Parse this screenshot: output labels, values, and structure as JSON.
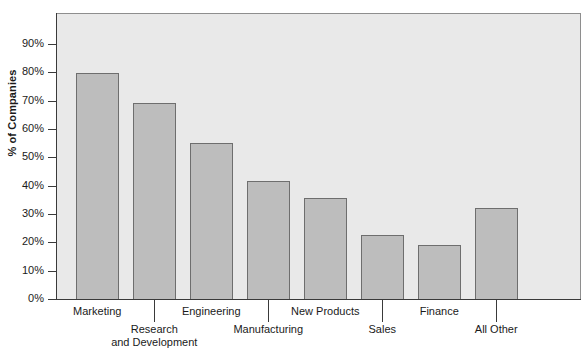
{
  "chart_data": {
    "type": "bar",
    "title": "",
    "xlabel": "",
    "ylabel": "% of Companies",
    "categories": [
      "Marketing",
      "Research and Development",
      "Engineering",
      "Manufacturing",
      "New Products",
      "Sales",
      "Finance",
      "All Other"
    ],
    "values": [
      80,
      69.5,
      55.5,
      42,
      36,
      23,
      19.5,
      32.3
    ],
    "ylim": [
      0,
      90
    ],
    "ytick_values": [
      0,
      10,
      20,
      30,
      40,
      50,
      60,
      70,
      80,
      90
    ],
    "ytick_labels": [
      "0%",
      "10%",
      "20%",
      "30%",
      "40%",
      "50%",
      "60%",
      "70%",
      "80%",
      "90%"
    ],
    "grid": false,
    "legend": null,
    "legend_position": "none",
    "series": [
      {
        "name": "% of Companies",
        "values": [
          80,
          69.5,
          55.5,
          42,
          36,
          23,
          19.5,
          32.3
        ]
      }
    ]
  },
  "axis": {
    "y_title": "% of Companies"
  },
  "x_labels": [
    {
      "label": "Marketing",
      "row": 0
    },
    {
      "label": "Research\nand Development",
      "row": 1
    },
    {
      "label": "Engineering",
      "row": 0
    },
    {
      "label": "Manufacturing",
      "row": 1
    },
    {
      "label": "New Products",
      "row": 0
    },
    {
      "label": "Sales",
      "row": 1
    },
    {
      "label": "Finance",
      "row": 0
    },
    {
      "label": "All Other",
      "row": 1
    }
  ],
  "colors": {
    "bar_fill": "#bdbdbd",
    "bar_border": "#6e6e6e",
    "plot_background": "#e9e9e9",
    "axis": "#3a3a3a",
    "text": "#1a1a1a"
  }
}
